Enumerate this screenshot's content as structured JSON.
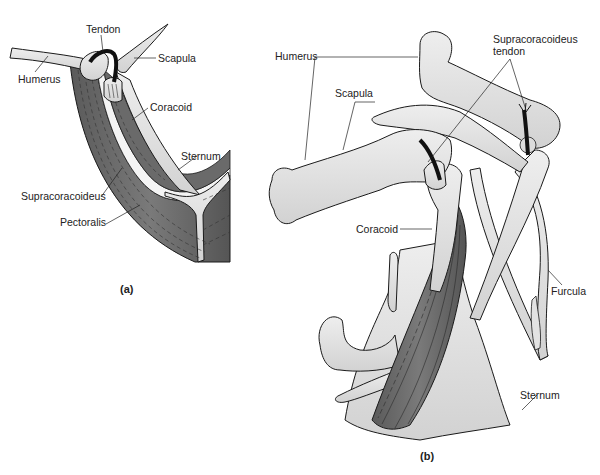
{
  "corner_text": "Wing flight",
  "panel_a": {
    "caption": "(a)",
    "labels": {
      "tendon": "Tendon",
      "scapula": "Scapula",
      "humerus": "Humerus",
      "coracoid": "Coracoid",
      "sternum": "Sternum",
      "supracoracoideus": "Supracoracoideus",
      "pectoralis": "Pectoralis"
    }
  },
  "panel_b": {
    "caption": "(b)",
    "labels": {
      "humerus": "Humerus",
      "scapula": "Scapula",
      "supracoracoideus_tendon_line1": "Supracoracoideus",
      "supracoracoideus_tendon_line2": "tendon",
      "coracoid": "Coracoid",
      "furcula": "Furcula",
      "sternum": "Sternum"
    }
  },
  "colors": {
    "bone": "#e4e4e4",
    "bone_shade": "#cfcfcf",
    "muscle": "#6e6e6e",
    "muscle_dark": "#4a4a4a",
    "tendon": "#111111",
    "outline": "#1a1a1a"
  }
}
